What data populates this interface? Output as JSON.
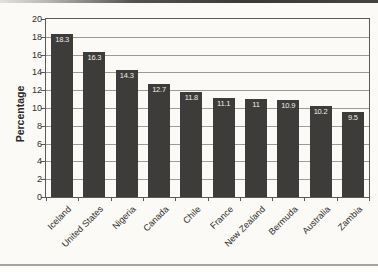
{
  "chart_data": {
    "type": "bar",
    "title": "",
    "xlabel": "",
    "ylabel": "Percentage",
    "categories": [
      "Iceland",
      "United States",
      "Nigeria",
      "Canada",
      "Chile",
      "France",
      "New Zealand",
      "Bermuda",
      "Australia",
      "Zambia"
    ],
    "values": [
      18.3,
      16.3,
      14.3,
      12.7,
      11.8,
      11.1,
      11,
      10.9,
      10.2,
      9.5
    ],
    "value_labels": [
      "18.3",
      "16.3",
      "14.3",
      "12.7",
      "11.8",
      "11.1",
      "11",
      "10.9",
      "10.2",
      "9.5"
    ],
    "ylim": [
      0,
      20
    ],
    "yticks": [
      0,
      2,
      4,
      6,
      8,
      10,
      12,
      14,
      16,
      18,
      20
    ],
    "grid": true,
    "legend": "none",
    "colors": {
      "bar": "#3d3c3b",
      "value_label": "#efeeea",
      "gridline": "#9a9a97",
      "axis": "#5c5a57",
      "tick_label": "#2f2e2c",
      "background": "#fbfaf7"
    }
  }
}
